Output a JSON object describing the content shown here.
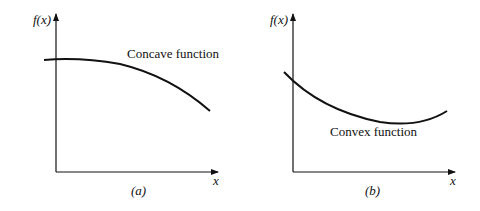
{
  "panels": [
    {
      "id": "a",
      "caption": "(a)",
      "y_label": "f(x)",
      "x_label": "x",
      "curve_label": "Concave function"
    },
    {
      "id": "b",
      "caption": "(b)",
      "y_label": "f(x)",
      "x_label": "x",
      "curve_label": "Convex function"
    }
  ],
  "colors": {
    "ink": "#111111",
    "background": "#ffffff"
  }
}
